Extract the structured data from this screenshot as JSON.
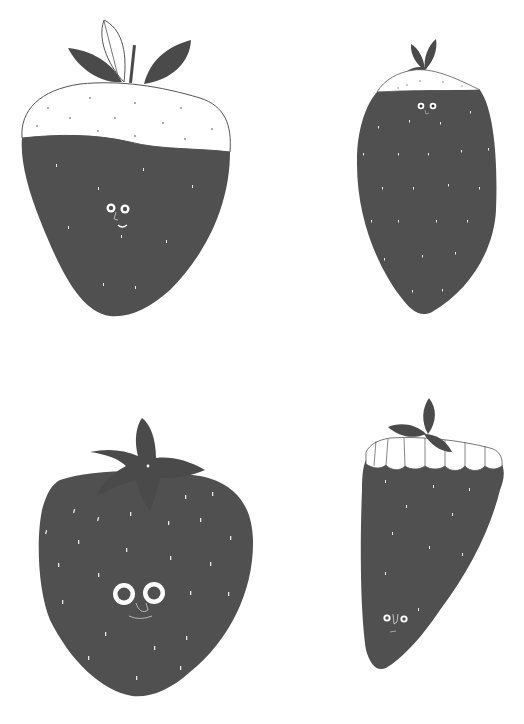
{
  "canvas": {
    "width": 524,
    "height": 724,
    "background": "#ffffff"
  },
  "colors": {
    "berry": "#505050",
    "leaf": "#4a4a4a",
    "outline": "#555555",
    "seed": "#e8e8e8",
    "white": "#ffffff"
  },
  "strawberries": [
    {
      "id": "top-left",
      "description": "Large strawberry with white chocolate dipped top, wavy line, two dark leaves, one outlined leaf and a stem",
      "face": "small eyes, nose, smile"
    },
    {
      "id": "top-right",
      "description": "Tall oval strawberry with white cap and small leaf cluster",
      "face": "small eyes and nose near top"
    },
    {
      "id": "bottom-left",
      "description": "Classic round strawberry with five-point calyx and many white seeds",
      "face": "large eyes, nose, smile"
    },
    {
      "id": "bottom-right",
      "description": "Tapered strawberry with tooth-like scalloped white top and leaf sprig",
      "face": "small eyes and nose near bottom"
    }
  ]
}
